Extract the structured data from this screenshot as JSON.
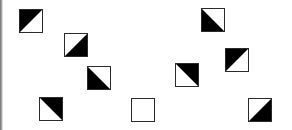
{
  "board": {
    "colors": {
      "dark": "#000000",
      "light": "#ffffff",
      "border": "#2b2b2b"
    },
    "tiles": [
      {
        "id": 1,
        "x": 19,
        "y": 9,
        "black": "top-left"
      },
      {
        "id": 2,
        "x": 64,
        "y": 33,
        "black": "bottom-right"
      },
      {
        "id": 3,
        "x": 87,
        "y": 66,
        "black": "bottom-left"
      },
      {
        "id": 4,
        "x": 39,
        "y": 97,
        "black": "top-right"
      },
      {
        "id": 5,
        "x": 131,
        "y": 98,
        "black": "none"
      },
      {
        "id": 6,
        "x": 201,
        "y": 8,
        "black": "bottom-left"
      },
      {
        "id": 7,
        "x": 225,
        "y": 48,
        "black": "top-left"
      },
      {
        "id": 8,
        "x": 175,
        "y": 63,
        "black": "top-right"
      },
      {
        "id": 9,
        "x": 248,
        "y": 98,
        "black": "bottom-right"
      }
    ]
  }
}
